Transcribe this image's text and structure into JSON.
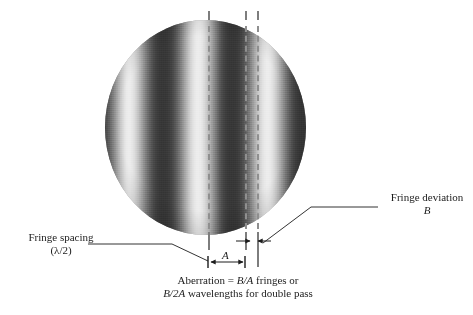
{
  "figure": {
    "type": "interferogram-annotated-diagram",
    "background_color": "#ffffff",
    "ink_color": "#1c1c1c"
  },
  "interferogram": {
    "shape": "circle",
    "center_x": 205,
    "center_y": 127,
    "diameter": 201,
    "fringe_orientation": "vertical",
    "fringe_curvature": "slight bow to the right",
    "bright_band_count": 4,
    "dark_value": "#3c3c3c",
    "bright_value": "#efefef",
    "mid_value": "#8a8a8a"
  },
  "reference_lines": {
    "count": 3,
    "style": "dashed",
    "color": "#8f8f8f",
    "x_positions": [
      208,
      245,
      257
    ],
    "description": "vertical dashed fiducial lines marking nominal fringe centers"
  },
  "dimensions": {
    "a": {
      "label": "A",
      "meaning": "fringe spacing",
      "x_start": 208,
      "x_end": 245,
      "y": 262,
      "arrow_style": "double-headed outward"
    },
    "b": {
      "label": "B",
      "meaning": "fringe deviation",
      "x_start": 240,
      "x_end": 265,
      "y": 241,
      "arrow_style": "double inward pointing"
    }
  },
  "annotations": {
    "fringe_spacing": {
      "line1": "Fringe spacing",
      "line2": "(λ/2)",
      "x": 14,
      "y": 231
    },
    "fringe_deviation": {
      "line1": "Fringe deviation",
      "line2": "B",
      "line2_italic": true,
      "x": 385,
      "y": 191
    }
  },
  "caption": {
    "line1_prefix": "Aberration = ",
    "line1_math": "B/A",
    "line1_suffix": " fringes or",
    "line2_math": "B/2A",
    "line2_suffix": " wavelengths for double pass",
    "x": 238,
    "y": 276
  }
}
